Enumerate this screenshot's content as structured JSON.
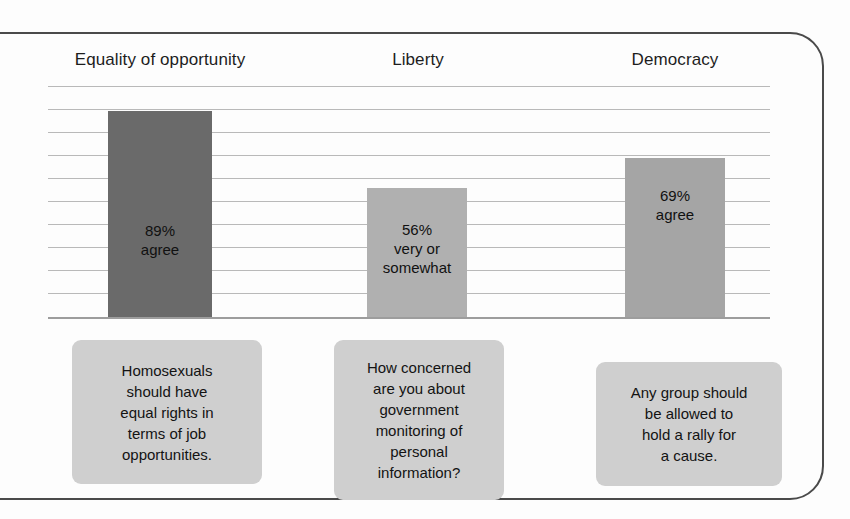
{
  "figure": {
    "background_color": "#fdfdfd",
    "frame_color": "#4a4a4a",
    "gridline_color": "#b9b9b9",
    "baseline_color": "#9d9d9d"
  },
  "columns": [
    {
      "header": "Equality of opportunity"
    },
    {
      "header": "Liberty"
    },
    {
      "header": "Democracy"
    }
  ],
  "questions": [
    {
      "text": "Homosexuals should have equal rights in terms of job opportunities."
    },
    {
      "text": "How concerned are you about government monitoring of personal information?"
    },
    {
      "text": "Any group should be allowed to hold a rally for a cause."
    }
  ],
  "chart_data": {
    "type": "bar",
    "title": "",
    "subtitle": "",
    "xlabel": "",
    "ylabel": "",
    "ylim": [
      0,
      100
    ],
    "grid": true,
    "gridlines_count": 10,
    "legend": "none",
    "categories": [
      "Equality of opportunity",
      "Liberty",
      "Democracy"
    ],
    "values": [
      89,
      56,
      69
    ],
    "value_labels": [
      "89%",
      "56%",
      "69%"
    ],
    "bar_label_lines": [
      [
        "89%",
        "agree"
      ],
      [
        "56%",
        "very or",
        "somewhat"
      ],
      [
        "69%",
        "agree"
      ]
    ],
    "bar_colors": [
      "#6a6a6a",
      "#b0b0b0",
      "#a5a5a5"
    ],
    "question_text": [
      "Homosexuals should have equal rights in terms of job opportunities.",
      "How concerned are you about government monitoring of personal information?",
      "Any group should be allowed to hold a rally for a cause."
    ],
    "question_line_breaks": [
      [
        "Homosexuals",
        "should have",
        "equal rights in",
        "terms of job",
        "opportunities."
      ],
      [
        "How concerned",
        "are you about",
        "government",
        "monitoring of",
        "personal",
        "information?"
      ],
      [
        "Any group should",
        "be allowed to",
        "hold a rally for",
        "a cause."
      ]
    ]
  }
}
